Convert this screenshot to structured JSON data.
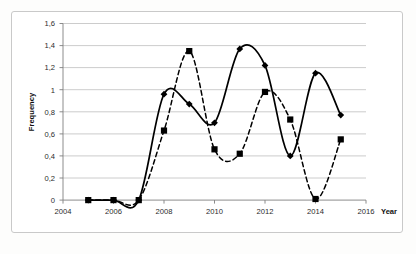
{
  "chart_data": {
    "type": "line",
    "title": "",
    "subtitle": "",
    "xlabel": "Year",
    "ylabel": "Frequency",
    "xlim": [
      2004,
      2016
    ],
    "ylim": [
      0,
      1.6
    ],
    "grid": true,
    "grid_axis": "y",
    "legend": "none",
    "x_tick_labels": [
      "2004",
      "2006",
      "2008",
      "2010",
      "2012",
      "2014",
      "2016"
    ],
    "x_tick_values": [
      2004,
      2006,
      2008,
      2010,
      2012,
      2014,
      2016
    ],
    "y_tick_labels": [
      "0",
      "0,2",
      "0,4",
      "0,6",
      "0,8",
      "1",
      "1,2",
      "1,4",
      "1,6"
    ],
    "y_tick_values": [
      0,
      0.2,
      0.4,
      0.6,
      0.8,
      1,
      1.2,
      1.4,
      1.6
    ],
    "decimal_separator": ",",
    "smoothed_lines": true,
    "series": [
      {
        "name": "series-solid-diamond",
        "line_style": "solid",
        "marker": "diamond",
        "color": "#000000",
        "x": [
          2005,
          2006,
          2007,
          2008,
          2009,
          2010,
          2011,
          2012,
          2013,
          2014,
          2015
        ],
        "values": [
          0,
          0,
          0,
          0.96,
          0.87,
          0.7,
          1.37,
          1.22,
          0.4,
          1.15,
          0.77
        ]
      },
      {
        "name": "series-dashed-square",
        "line_style": "dashed",
        "marker": "square",
        "color": "#000000",
        "x": [
          2005,
          2006,
          2007,
          2008,
          2009,
          2010,
          2011,
          2012,
          2013,
          2014,
          2015
        ],
        "values": [
          0,
          0,
          0,
          0.63,
          1.35,
          0.46,
          0.42,
          0.98,
          0.73,
          0.01,
          0.55
        ]
      }
    ]
  },
  "axes": {
    "y_title": "Frequency",
    "x_title": "Year",
    "y_labels": [
      "1,6",
      "1,4",
      "1,2",
      "1",
      "0,8",
      "0,6",
      "0,4",
      "0,2",
      "0"
    ],
    "x_labels": [
      "2004",
      "2006",
      "2008",
      "2010",
      "2012",
      "2014",
      "2016"
    ]
  },
  "colors": {
    "series_line": "#000000",
    "gridline": "#bfbfbf",
    "axis_line": "#7f7f7f",
    "frame_border": "#c9c9c9",
    "text": "#2b2b2b",
    "background": "#ffffff"
  }
}
